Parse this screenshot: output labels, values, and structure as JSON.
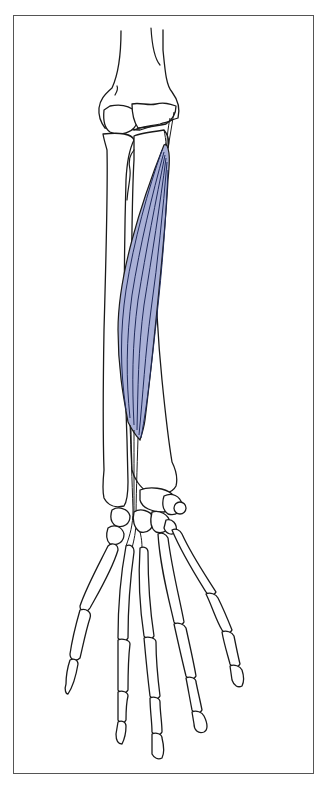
{
  "figure": {
    "type": "anatomical-illustration",
    "subject": "forearm and hand skeleton (anterior view) with highlighted muscle",
    "colors": {
      "muscle_fill": "#a9b0d6",
      "muscle_fiber": "#1f2a5a",
      "bone_outline": "#1a1a1a",
      "bone_fill": "#ffffff",
      "frame_border": "#555555",
      "background": "#ffffff"
    },
    "regions": [
      "humerus-distal",
      "elbow-joint",
      "radius",
      "ulna",
      "highlighted-muscle",
      "tendon",
      "carpals",
      "metacarpals",
      "phalanges"
    ]
  }
}
